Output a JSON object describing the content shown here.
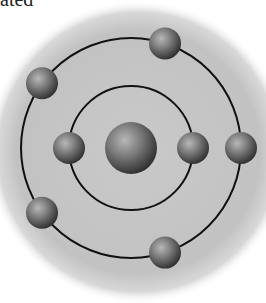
{
  "caption_fragment": "ated",
  "diagram": {
    "colors": {
      "background_disc": "#c4c4c4",
      "orbit_line": "#111111",
      "particle_light": "#b5b5b5",
      "particle_mid": "#6e6e6e",
      "particle_dark": "#2e2e2e"
    },
    "nucleus": {
      "label": "nucleus"
    },
    "orbits": [
      {
        "name": "inner-orbit",
        "electron_count": 2,
        "electron_angles_deg": [
          180,
          0
        ]
      },
      {
        "name": "outer-orbit",
        "electron_count": 5,
        "electron_angles_deg": [
          -72,
          -144,
          0,
          144,
          72
        ]
      }
    ]
  }
}
